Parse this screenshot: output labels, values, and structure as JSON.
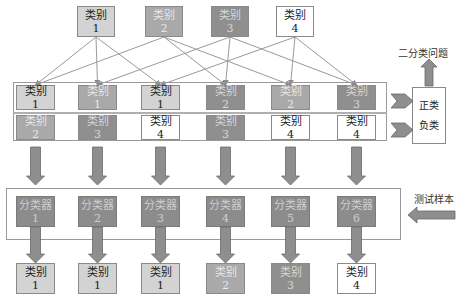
{
  "class_label": "类别",
  "top_classes": [
    {
      "label": "类别",
      "num": "1",
      "shade": "c1"
    },
    {
      "label": "类别",
      "num": "2",
      "shade": "c2"
    },
    {
      "label": "类别",
      "num": "3",
      "shade": "c3"
    },
    {
      "label": "类别",
      "num": "4",
      "shade": "c4"
    }
  ],
  "pairs": [
    {
      "top": {
        "label": "类别",
        "num": "1",
        "shade": "c1"
      },
      "bottom": {
        "label": "类别",
        "num": "2",
        "shade": "c2"
      }
    },
    {
      "top": {
        "label": "类别",
        "num": "1",
        "shade": "c2"
      },
      "bottom": {
        "label": "类别",
        "num": "3",
        "shade": "c3"
      }
    },
    {
      "top": {
        "label": "类别",
        "num": "1",
        "shade": "c1"
      },
      "bottom": {
        "label": "类别",
        "num": "4",
        "shade": "c4"
      }
    },
    {
      "top": {
        "label": "类别",
        "num": "2",
        "shade": "c3"
      },
      "bottom": {
        "label": "类别",
        "num": "3",
        "shade": "c3"
      }
    },
    {
      "top": {
        "label": "类别",
        "num": "2",
        "shade": "c2"
      },
      "bottom": {
        "label": "类别",
        "num": "4",
        "shade": "c4"
      }
    },
    {
      "top": {
        "label": "类别",
        "num": "3",
        "shade": "c3"
      },
      "bottom": {
        "label": "类别",
        "num": "4",
        "shade": "c4"
      }
    }
  ],
  "classifiers": [
    {
      "label": "分类器",
      "num": "1"
    },
    {
      "label": "分类器",
      "num": "2"
    },
    {
      "label": "分类器",
      "num": "3"
    },
    {
      "label": "分类器",
      "num": "4"
    },
    {
      "label": "分类器",
      "num": "5"
    },
    {
      "label": "分类器",
      "num": "6"
    }
  ],
  "results": [
    {
      "label": "类别",
      "num": "1",
      "shade": "c1"
    },
    {
      "label": "类别",
      "num": "1",
      "shade": "c1"
    },
    {
      "label": "类别",
      "num": "1",
      "shade": "c1"
    },
    {
      "label": "类别",
      "num": "2",
      "shade": "c2"
    },
    {
      "label": "类别",
      "num": "3",
      "shade": "c3"
    },
    {
      "label": "类别",
      "num": "4",
      "shade": "c4"
    }
  ],
  "binary_problem": {
    "title": "二分类问题",
    "positive": "正类",
    "negative": "负类"
  },
  "test_sample_label": "测试样本",
  "connections": [
    [
      0,
      0
    ],
    [
      0,
      1
    ],
    [
      0,
      2
    ],
    [
      1,
      0
    ],
    [
      1,
      3
    ],
    [
      1,
      4
    ],
    [
      2,
      1
    ],
    [
      2,
      3
    ],
    [
      2,
      5
    ],
    [
      3,
      2
    ],
    [
      3,
      4
    ],
    [
      3,
      5
    ]
  ]
}
